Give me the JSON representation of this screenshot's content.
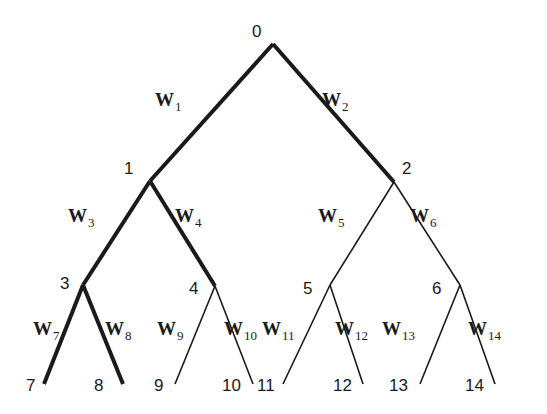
{
  "diagram": {
    "type": "binary-tree",
    "line_color": "#1a1a1a",
    "nodes": [
      {
        "id": "0",
        "x": 273,
        "y": 44,
        "lx": 252,
        "ly": 37
      },
      {
        "id": "1",
        "x": 150,
        "y": 181,
        "lx": 124,
        "ly": 174
      },
      {
        "id": "2",
        "x": 394,
        "y": 182,
        "lx": 402,
        "ly": 174
      },
      {
        "id": "3",
        "x": 83,
        "y": 285,
        "lx": 60,
        "ly": 289
      },
      {
        "id": "4",
        "x": 215,
        "y": 286,
        "lx": 189,
        "ly": 294
      },
      {
        "id": "5",
        "x": 330,
        "y": 285,
        "lx": 303,
        "ly": 294
      },
      {
        "id": "6",
        "x": 460,
        "y": 285,
        "lx": 432,
        "ly": 294
      },
      {
        "id": "7",
        "x": 44,
        "y": 384,
        "lx": 26,
        "ly": 391
      },
      {
        "id": "8",
        "x": 123,
        "y": 384,
        "lx": 94,
        "ly": 391
      },
      {
        "id": "9",
        "x": 175,
        "y": 384,
        "lx": 154,
        "ly": 391
      },
      {
        "id": "10",
        "x": 253,
        "y": 384,
        "lx": 222,
        "ly": 391
      },
      {
        "id": "11",
        "x": 283,
        "y": 384,
        "lx": 257,
        "ly": 391
      },
      {
        "id": "12",
        "x": 363,
        "y": 384,
        "lx": 333,
        "ly": 391
      },
      {
        "id": "13",
        "x": 420,
        "y": 384,
        "lx": 389,
        "ly": 391
      },
      {
        "id": "14",
        "x": 495,
        "y": 384,
        "lx": 465,
        "ly": 391
      }
    ],
    "edges": [
      {
        "from": "0",
        "to": "1",
        "weight": "W",
        "sub": "1",
        "thick": true,
        "wx": 155,
        "wy": 106
      },
      {
        "from": "0",
        "to": "2",
        "weight": "W",
        "sub": "2",
        "thick": true,
        "wx": 322,
        "wy": 106
      },
      {
        "from": "1",
        "to": "3",
        "weight": "W",
        "sub": "3",
        "thick": true,
        "wx": 68,
        "wy": 222
      },
      {
        "from": "1",
        "to": "4",
        "weight": "W",
        "sub": "4",
        "thick": true,
        "wx": 175,
        "wy": 222
      },
      {
        "from": "2",
        "to": "5",
        "weight": "W",
        "sub": "5",
        "thick": false,
        "wx": 318,
        "wy": 222
      },
      {
        "from": "2",
        "to": "6",
        "weight": "W",
        "sub": "6",
        "thick": false,
        "wx": 410,
        "wy": 222
      },
      {
        "from": "3",
        "to": "7",
        "weight": "W",
        "sub": "7",
        "thick": true,
        "wx": 33,
        "wy": 335
      },
      {
        "from": "3",
        "to": "8",
        "weight": "W",
        "sub": "8",
        "thick": true,
        "wx": 105,
        "wy": 335
      },
      {
        "from": "4",
        "to": "9",
        "weight": "W",
        "sub": "9",
        "thick": false,
        "wx": 157,
        "wy": 335
      },
      {
        "from": "4",
        "to": "10",
        "weight": "W",
        "sub": "10",
        "thick": false,
        "wx": 224,
        "wy": 335
      },
      {
        "from": "5",
        "to": "11",
        "weight": "W",
        "sub": "11",
        "thick": false,
        "wx": 262,
        "wy": 335
      },
      {
        "from": "5",
        "to": "12",
        "weight": "W",
        "sub": "12",
        "thick": false,
        "wx": 335,
        "wy": 335
      },
      {
        "from": "6",
        "to": "13",
        "weight": "W",
        "sub": "13",
        "thick": false,
        "wx": 382,
        "wy": 335
      },
      {
        "from": "6",
        "to": "14",
        "weight": "W",
        "sub": "14",
        "thick": false,
        "wx": 468,
        "wy": 335
      }
    ]
  }
}
